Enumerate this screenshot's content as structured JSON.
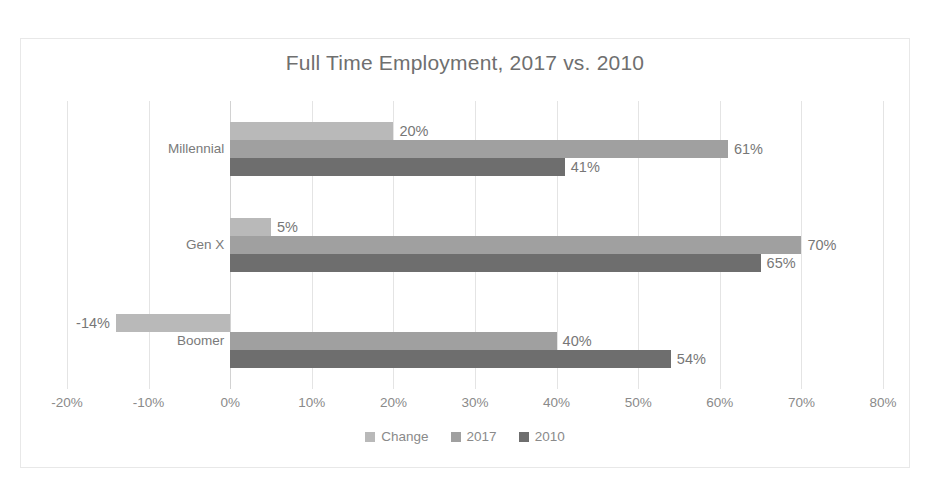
{
  "chart_data": {
    "type": "bar",
    "orientation": "horizontal",
    "title": "Full Time Employment, 2017 vs. 2010",
    "xlabel": "",
    "ylabel": "",
    "xlim": [
      -20,
      80
    ],
    "xtick_step": 10,
    "xticks": [
      "-20%",
      "-10%",
      "0%",
      "10%",
      "20%",
      "30%",
      "40%",
      "50%",
      "60%",
      "70%",
      "80%"
    ],
    "xtick_values": [
      -20,
      -10,
      0,
      10,
      20,
      30,
      40,
      50,
      60,
      70,
      80
    ],
    "grid": true,
    "legend_position": "bottom",
    "categories": [
      "Millennial",
      "Gen X",
      "Boomer"
    ],
    "series": [
      {
        "name": "Change",
        "color": "#b9b9b9",
        "values": [
          20,
          5,
          -14
        ],
        "labels": [
          "20%",
          "5%",
          "-14%"
        ]
      },
      {
        "name": "2017",
        "color": "#a0a0a0",
        "values": [
          61,
          70,
          40
        ],
        "labels": [
          "61%",
          "70%",
          "40%"
        ]
      },
      {
        "name": "2010",
        "color": "#6e6e6e",
        "values": [
          41,
          65,
          54
        ],
        "labels": [
          "41%",
          "65%",
          "54%"
        ]
      }
    ],
    "legend": [
      {
        "label": "Change",
        "color": "#b9b9b9"
      },
      {
        "label": "2017",
        "color": "#a0a0a0"
      },
      {
        "label": "2010",
        "color": "#6e6e6e"
      }
    ]
  }
}
